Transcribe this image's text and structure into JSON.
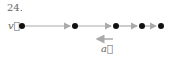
{
  "problem_number": "24.",
  "labels": {
    "velocity": "v⃗",
    "acceleration": "a⃗"
  },
  "colors": {
    "dot": "#111111",
    "arrow": "#aaaaaa"
  },
  "motion_diagram": {
    "dot_x": [
      22,
      75,
      116,
      142,
      161
    ],
    "dot_y": 26,
    "acceleration_direction": "left"
  }
}
